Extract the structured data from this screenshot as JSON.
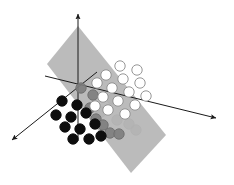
{
  "figure": {
    "type": "diagram",
    "width": 234,
    "height": 185,
    "background_color": "#ffffff"
  },
  "colors": {
    "plane_fill": "#b4b4b4",
    "plane_fill_light": "#c2c2c2",
    "axis_stroke": "#1a1a1a",
    "point_white_fill": "#ffffff",
    "point_white_stroke": "#8a8a8a",
    "point_black_fill": "#0d0d0d",
    "point_black_stroke": "#0d0d0d",
    "point_gray_fill": "#7d7d7d",
    "point_gray_stroke": "#6e6e6e",
    "point_shadow_fill": "#9a9a9a",
    "background": "#ffffff"
  },
  "plane": {
    "name": "separating-hyperplane",
    "shape": "parallelogram",
    "opacity": 0.9,
    "corners": [
      {
        "x": 78,
        "y": 26
      },
      {
        "x": 166,
        "y": 135
      },
      {
        "x": 131,
        "y": 173
      },
      {
        "x": 47,
        "y": 64
      }
    ]
  },
  "axes": [
    {
      "name": "vertical-axis",
      "label": "z",
      "x1": 78,
      "y1": 141,
      "x2": 78,
      "y2": 14,
      "arrow_at": "end"
    },
    {
      "name": "right-axis",
      "label": "y",
      "x1": 45,
      "y1": 76,
      "x2": 216,
      "y2": 118,
      "arrow_at": "end"
    },
    {
      "name": "front-left-axis",
      "label": "x",
      "x1": 97,
      "y1": 72,
      "x2": 12,
      "y2": 140,
      "arrow_at": "end"
    }
  ],
  "points": {
    "white_class_label": "class-positive",
    "black_class_label": "class-negative",
    "gray_class_label": "boundary-point",
    "radius": 5.2,
    "white": [
      {
        "x": 120,
        "y": 66
      },
      {
        "x": 137,
        "y": 70
      },
      {
        "x": 106,
        "y": 75
      },
      {
        "x": 123,
        "y": 79
      },
      {
        "x": 140,
        "y": 83
      },
      {
        "x": 97,
        "y": 83
      },
      {
        "x": 112,
        "y": 88
      },
      {
        "x": 129,
        "y": 92
      },
      {
        "x": 146,
        "y": 96
      },
      {
        "x": 103,
        "y": 97
      },
      {
        "x": 118,
        "y": 101
      },
      {
        "x": 135,
        "y": 105
      },
      {
        "x": 95,
        "y": 106
      },
      {
        "x": 108,
        "y": 110
      },
      {
        "x": 125,
        "y": 114
      }
    ],
    "black": [
      {
        "x": 62,
        "y": 101
      },
      {
        "x": 77,
        "y": 105
      },
      {
        "x": 56,
        "y": 115
      },
      {
        "x": 71,
        "y": 117
      },
      {
        "x": 86,
        "y": 113
      },
      {
        "x": 65,
        "y": 127
      },
      {
        "x": 80,
        "y": 129
      },
      {
        "x": 95,
        "y": 124
      },
      {
        "x": 73,
        "y": 139
      },
      {
        "x": 89,
        "y": 139
      },
      {
        "x": 101,
        "y": 136
      }
    ],
    "gray": [
      {
        "x": 81,
        "y": 88
      },
      {
        "x": 93,
        "y": 95
      },
      {
        "x": 90,
        "y": 108
      },
      {
        "x": 96,
        "y": 119
      },
      {
        "x": 103,
        "y": 125
      },
      {
        "x": 110,
        "y": 133
      },
      {
        "x": 119,
        "y": 134
      }
    ],
    "shadow": [
      {
        "x": 112,
        "y": 99
      },
      {
        "x": 101,
        "y": 112
      },
      {
        "x": 117,
        "y": 120
      },
      {
        "x": 129,
        "y": 124
      },
      {
        "x": 136,
        "y": 130
      }
    ]
  }
}
